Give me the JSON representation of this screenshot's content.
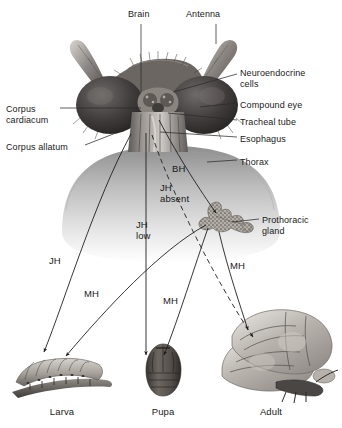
{
  "figure": {
    "background_color": "#ffffff",
    "text_color": "#191919",
    "line_color": "#2b2b2b"
  },
  "anatomy_labels": [
    {
      "id": "brain",
      "text": "Brain",
      "x": 128,
      "y": 9,
      "align": "left"
    },
    {
      "id": "antenna",
      "text": "Antenna",
      "x": 186,
      "y": 9,
      "align": "left"
    },
    {
      "id": "neuroendocrine",
      "text": "Neuroendocrine\ncells",
      "x": 240,
      "y": 68,
      "align": "left"
    },
    {
      "id": "compound-eye",
      "text": "Compound eye",
      "x": 240,
      "y": 100,
      "align": "left"
    },
    {
      "id": "tracheal-tube",
      "text": "Tracheal tube",
      "x": 240,
      "y": 117,
      "align": "left"
    },
    {
      "id": "esophagus",
      "text": "Esophagus",
      "x": 240,
      "y": 134,
      "align": "left"
    },
    {
      "id": "thorax",
      "text": "Thorax",
      "x": 240,
      "y": 157,
      "align": "left"
    },
    {
      "id": "corpus-cardiacum",
      "text": "Corpus\ncardiacum",
      "x": 6,
      "y": 104,
      "align": "left"
    },
    {
      "id": "corpus-allatum",
      "text": "Corpus allatum",
      "x": 6,
      "y": 142,
      "align": "left"
    },
    {
      "id": "prothoracic-gland",
      "text": "Prothoracic\ngland",
      "x": 262,
      "y": 215,
      "align": "left"
    }
  ],
  "hormone_labels": [
    {
      "id": "bh",
      "text": "BH",
      "x": 172,
      "y": 163
    },
    {
      "id": "jh-absent",
      "text": "JH\nabsent",
      "x": 160,
      "y": 182
    },
    {
      "id": "jh-low",
      "text": "JH\nlow",
      "x": 136,
      "y": 219
    },
    {
      "id": "jh",
      "text": "JH",
      "x": 49,
      "y": 255
    },
    {
      "id": "mh-larva",
      "text": "MH",
      "x": 84,
      "y": 288
    },
    {
      "id": "mh-pupa",
      "text": "MH",
      "x": 163,
      "y": 295
    },
    {
      "id": "mh-adult",
      "text": "MH",
      "x": 230,
      "y": 260
    }
  ],
  "stages": [
    {
      "id": "larva",
      "label": "Larva",
      "x": 62,
      "y": 407
    },
    {
      "id": "pupa",
      "label": "Pupa",
      "x": 163,
      "y": 407
    },
    {
      "id": "adult",
      "label": "Adult",
      "x": 271,
      "y": 407
    }
  ],
  "leader_lines": [
    {
      "id": "brain-leader",
      "d": "M141,24 L141,92"
    },
    {
      "id": "antenna-leader",
      "d": "M216,24 L216,44"
    },
    {
      "id": "neuroendocrine-leader",
      "d": "M237,74 L173,92"
    },
    {
      "id": "compound-eye-leader",
      "d": "M237,103 L200,107"
    },
    {
      "id": "tracheal-tube-leader",
      "d": "M237,120 L168,113"
    },
    {
      "id": "esophagus-leader",
      "d": "M237,137 L160,132"
    },
    {
      "id": "thorax-leader",
      "d": "M237,160 L207,162"
    },
    {
      "id": "corpus-cardiacum-leader",
      "d": "M60,108 L141,108"
    },
    {
      "id": "corpus-allatum-leader",
      "d": "M85,145 L121,131"
    },
    {
      "id": "prothoracic-leader",
      "d": "M259,219 L232,222"
    }
  ],
  "hormone_arrows": [
    {
      "id": "bh-arrow",
      "from": "neuroendocrine-cells",
      "to": "prothoracic-gland",
      "style": "solid",
      "d": "M159,120 C180,160 200,190 216,213"
    },
    {
      "id": "jh-absent-arrow",
      "from": "corpus-allatum",
      "to": "adult",
      "style": "dashed",
      "d": "M152,135 C170,190 215,280 253,337"
    },
    {
      "id": "jh-low-arrow",
      "from": "corpus-allatum",
      "to": "pupa",
      "style": "solid",
      "d": "M146,133 L146,355"
    },
    {
      "id": "jh-arrow",
      "from": "corpus-allatum",
      "to": "larva",
      "style": "solid",
      "d": "M131,134 C95,200 65,300 44,352"
    },
    {
      "id": "mh-larva-arrow",
      "from": "prothoracic-gland",
      "to": "larva",
      "style": "solid",
      "d": "M206,225 C160,250 105,310 66,356"
    },
    {
      "id": "mh-pupa-arrow",
      "from": "prothoracic-gland",
      "to": "pupa",
      "style": "solid",
      "d": "M208,228 C195,265 178,320 164,355"
    },
    {
      "id": "mh-adult-arrow",
      "from": "prothoracic-gland",
      "to": "adult",
      "style": "solid",
      "d": "M219,232 C228,270 240,305 248,330"
    }
  ]
}
